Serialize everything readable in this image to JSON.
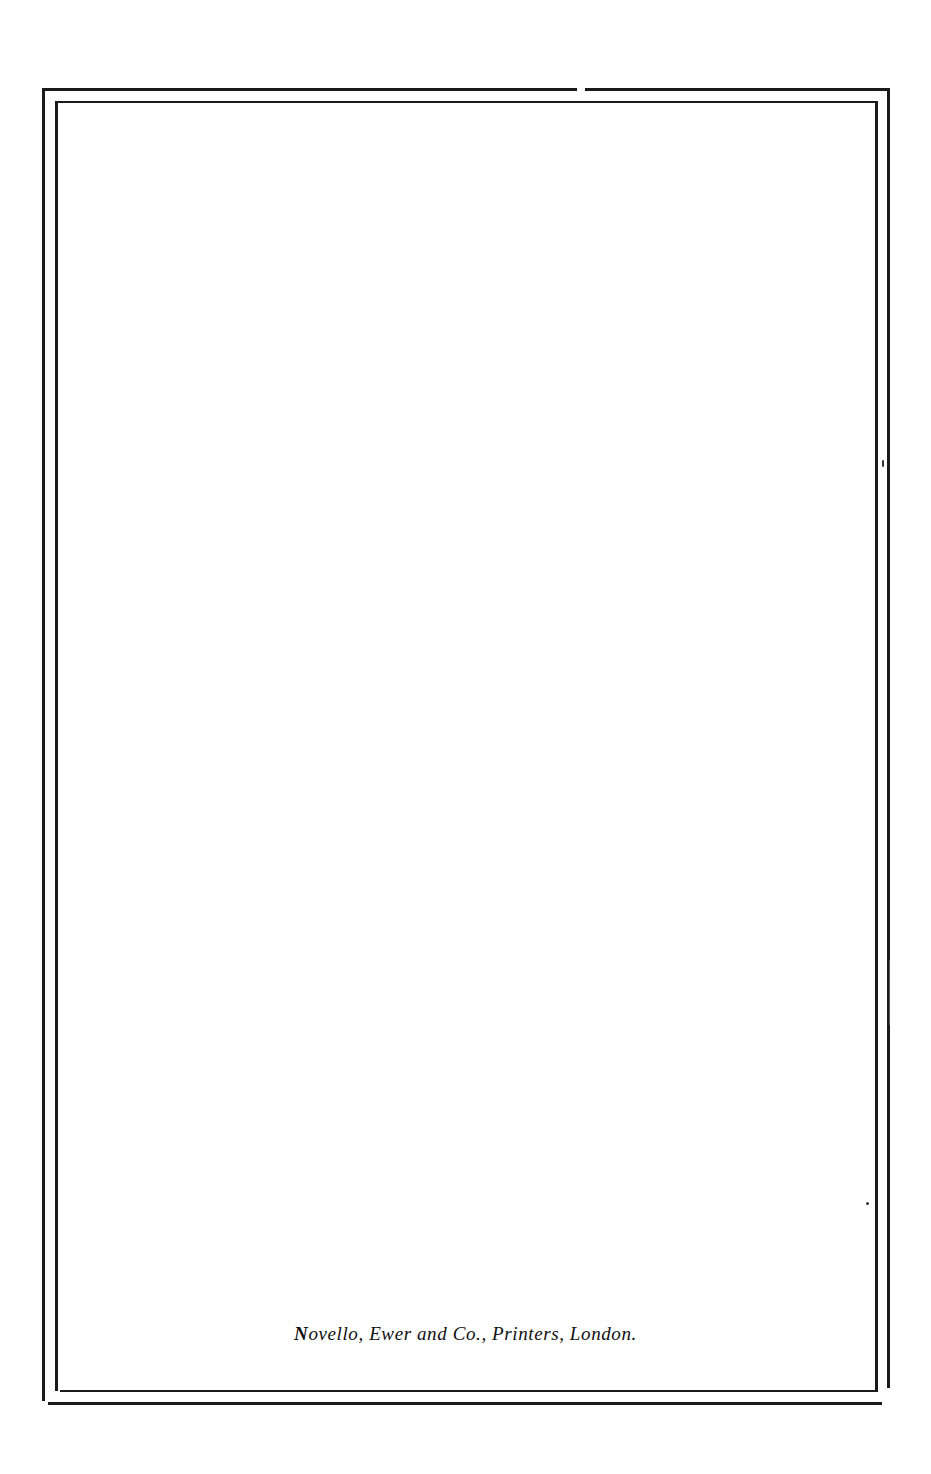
{
  "document": {
    "type": "printed book end page",
    "frame": {
      "style": "double rule border",
      "color": "#1a1a1a"
    },
    "imprint": {
      "initial": "N",
      "text": "ovello, Ewer and Co., Printers, London."
    }
  }
}
